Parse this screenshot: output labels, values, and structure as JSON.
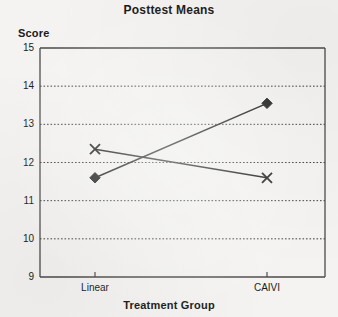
{
  "chart_data": {
    "type": "line",
    "title": "Posttest Means",
    "xlabel": "Treatment Group",
    "ylabel": "Score",
    "categories": [
      "Linear",
      "CAIVI"
    ],
    "series": [
      {
        "name": "diamond-series",
        "marker": "diamond",
        "values": [
          11.6,
          13.55
        ]
      },
      {
        "name": "cross-series",
        "marker": "x",
        "values": [
          12.35,
          11.6
        ]
      }
    ],
    "ylim": [
      9,
      15
    ],
    "yticks": [
      15,
      14,
      13,
      12,
      11,
      10,
      9
    ],
    "ytick_labels": [
      "15",
      "14",
      "13",
      "12",
      "11",
      "10",
      "9"
    ],
    "gridlines_y": [
      14,
      13,
      12,
      11,
      10
    ],
    "grid": true,
    "grid_style": "dotted",
    "legend": false,
    "line_color": "#1a1a1a",
    "frame_color": "#4a4a4a",
    "background": "#f4f3f1"
  }
}
